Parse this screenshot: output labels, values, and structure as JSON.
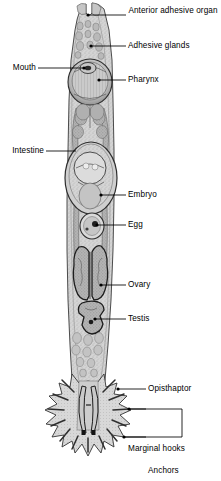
{
  "figure": {
    "ink_color": "#000000",
    "body_fill": "#d2d2d2",
    "organ_fill": "#bcbcbc",
    "background": "#ffffff"
  },
  "labels": {
    "anterior_adhesive_organ": "Anterior adhesive organ",
    "adhesive_glands": "Adhesive glands",
    "mouth": "Mouth",
    "pharynx": "Pharynx",
    "intestine": "Intestine",
    "embryo": "Embryo",
    "egg": "Egg",
    "ovary": "Ovary",
    "testis": "Testis",
    "opisthaptor": "Opisthaptor",
    "marginal_hooks": "Marginal hooks",
    "anchors": "Anchors"
  }
}
